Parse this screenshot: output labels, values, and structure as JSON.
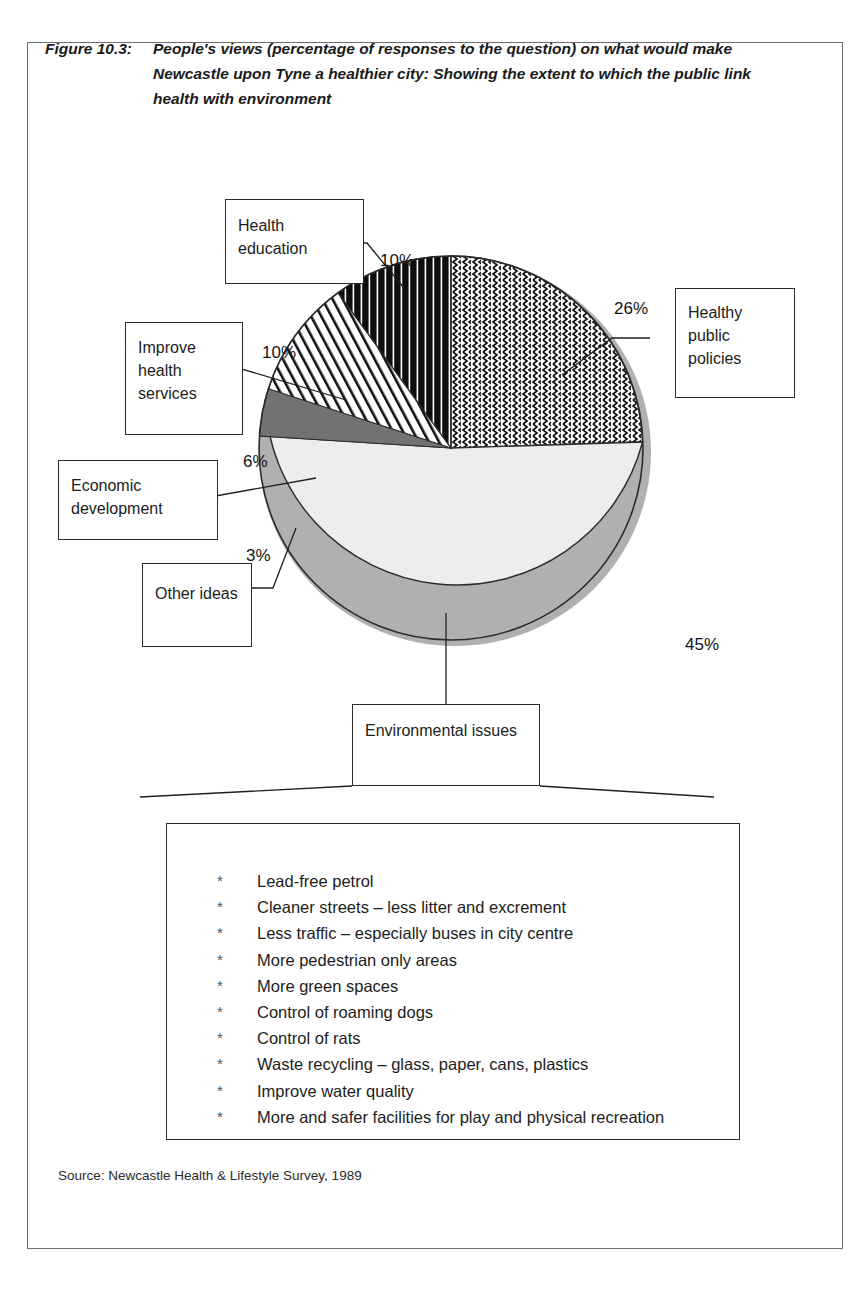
{
  "figure": {
    "number": "Figure 10.3:",
    "caption": "People's views (percentage of responses to the question) on what  would make Newcastle upon Tyne a healthier city: Showing the extent to which the public link health with environment",
    "source": "Source: Newcastle Health & Lifestyle Survey, 1989"
  },
  "callouts": {
    "health_education": "Health education",
    "improve_health_services": "Improve health services",
    "economic_development": "Economic development",
    "other_ideas": "Other ideas",
    "healthy_public_policies": "Healthy public policies",
    "environmental_issues": "Environmental issues"
  },
  "environmental_list": {
    "bullet": "*",
    "items": [
      "Lead-free petrol",
      "Cleaner streets – less litter and excrement",
      "Less traffic – especially buses in city centre",
      "More pedestrian only areas",
      "More green spaces",
      "Control of roaming dogs",
      "Control of rats",
      "Waste recycling – glass, paper, cans, plastics",
      "Improve water quality",
      "More and safer facilities for play and physical recreation"
    ]
  },
  "chart_data": {
    "type": "pie",
    "title": "People's views (percentage of responses to the question) on what would make Newcastle upon Tyne a healthier city: Showing the extent to which the public link health with environment",
    "labels": [
      "Healthy public policies",
      "Environmental issues",
      "Other ideas",
      "Economic development",
      "Improve health services",
      "Health education"
    ],
    "values": [
      26,
      45,
      3,
      6,
      10,
      10
    ],
    "value_labels": [
      "26%",
      "45%",
      "3%",
      "6%",
      "10%",
      "10%"
    ],
    "fills": [
      "wavy-zigzag-hatch",
      "light-grey-solid",
      "black-solid",
      "dark-grey-solid",
      "diagonal-line-hatch",
      "vertical-stripe-black"
    ],
    "colors": {
      "healthy_public_policies": "#ffffff",
      "environmental_issues": "#eceded",
      "other_ideas": "#121212",
      "economic_development": "#727272",
      "improve_health_services": "#ffffff",
      "health_education": "#0d0d0d",
      "outline": "#2b2b2b",
      "shadow": "#b4b4b4"
    },
    "start_angle_deg": 0,
    "direction": "clockwise",
    "legend": "callout-boxes-with-leader-lines",
    "grid": false
  }
}
